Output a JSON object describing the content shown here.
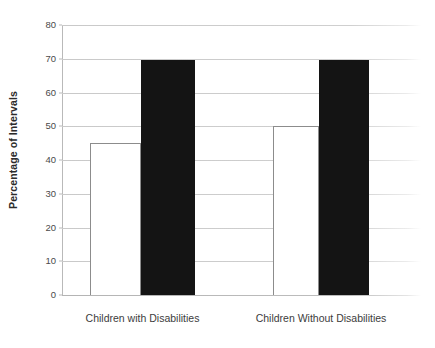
{
  "chart_data": {
    "type": "bar",
    "title": "",
    "xlabel": "",
    "ylabel": "Percentage of Intervals",
    "ylim": [
      0,
      80
    ],
    "yticks": [
      0,
      10,
      20,
      30,
      40,
      50,
      60,
      70,
      80
    ],
    "ytick_labels": [
      "0",
      "10",
      "20",
      "30",
      "40",
      "50",
      "60",
      "70",
      "80"
    ],
    "grid": true,
    "legend": "none",
    "categories": [
      "Children with Disabilities",
      "Children Without Disabilities"
    ],
    "series": [
      {
        "name": "open-bar",
        "style": "white-outline",
        "values": [
          45,
          50
        ]
      },
      {
        "name": "filled-bar",
        "style": "black-fill",
        "values": [
          69.5,
          69.5
        ]
      }
    ],
    "colors": {
      "open_bar_fill": "#ffffff",
      "open_bar_stroke": "#8c8c8c",
      "filled_bar_fill": "#141414",
      "gridline": "#c9c9c9",
      "axis": "#b9b9b9",
      "text": "#3a3a3a",
      "background": "#ffffff"
    }
  }
}
